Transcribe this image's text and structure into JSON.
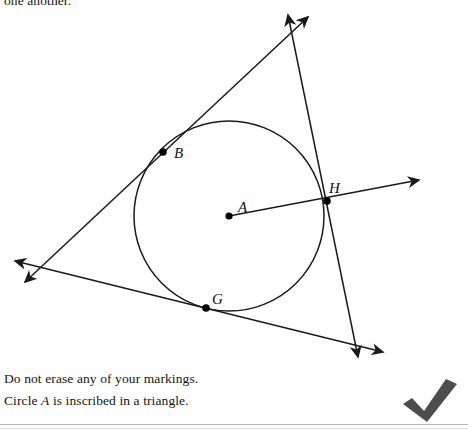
{
  "header": {
    "continued_text": "one another."
  },
  "figure": {
    "stroke_color": "#1a1a1a",
    "point_color": "#000000",
    "circle": {
      "cx": 229,
      "cy": 216,
      "r": 95,
      "label": "A"
    },
    "center_point": {
      "x": 229,
      "y": 216,
      "label": "A",
      "label_x": 238,
      "label_y": 212
    },
    "points": [
      {
        "name": "B",
        "x": 163,
        "y": 152,
        "label": "B",
        "label_x": 174,
        "label_y": 157
      },
      {
        "name": "H",
        "x": 327,
        "y": 201,
        "label": "H",
        "label_x": 330,
        "label_y": 192
      },
      {
        "name": "G",
        "x": 206,
        "y": 308,
        "label": "G",
        "label_x": 212,
        "label_y": 303
      }
    ],
    "radius_segment": {
      "from": "A",
      "to": "H",
      "extends_to_arrow": true,
      "arrow_tip_x": 419,
      "arrow_tip_y": 180
    },
    "tangent_lines": [
      {
        "tangent_at": "B",
        "x1": 308,
        "y1": 17,
        "x2": 25,
        "y2": 282,
        "arrows": "both"
      },
      {
        "tangent_at": "H",
        "x1": 288,
        "y1": 15,
        "x2": 358,
        "y2": 357,
        "arrows": "both"
      },
      {
        "tangent_at": "G",
        "x1": 15,
        "y1": 261,
        "x2": 383,
        "y2": 352,
        "arrows": "both"
      }
    ]
  },
  "caption": {
    "line1": "Do not erase any of your markings.",
    "line2_prefix": "Circle ",
    "line2_italic": "A",
    "line2_suffix": " is inscribed in a triangle."
  },
  "marks": {
    "check_icon": "check-mark",
    "check_color": "#4d4d4d"
  }
}
